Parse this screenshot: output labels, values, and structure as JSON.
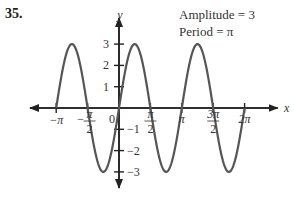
{
  "problem_number": "35.",
  "annotations": {
    "amplitude": "Amplitude = 3",
    "period": "Period = π"
  },
  "chart_data": {
    "type": "line",
    "title": "",
    "function": "y = 3 sin(2x)",
    "xlabel": "x",
    "ylabel": "y",
    "xlim": [
      -3.1416,
      6.2832
    ],
    "ylim": [
      -3,
      3
    ],
    "x_ticks": [
      "-π",
      "-π/2",
      "0",
      "π/2",
      "π",
      "3π/2",
      "2π"
    ],
    "y_ticks": [
      "3",
      "2",
      "1",
      "-1",
      "-2",
      "-3"
    ],
    "grid": false,
    "series": [
      {
        "name": "y = 3 sin 2x",
        "x": [
          -3.1416,
          -2.3562,
          -1.5708,
          -0.7854,
          0,
          0.7854,
          1.5708,
          2.3562,
          3.1416,
          3.927,
          4.7124,
          5.4978,
          6.2832
        ],
        "y": [
          0,
          3,
          0,
          -3,
          0,
          3,
          0,
          -3,
          0,
          3,
          0,
          -3,
          0
        ]
      }
    ],
    "annotations": [
      "Amplitude = 3",
      "Period = π"
    ]
  }
}
